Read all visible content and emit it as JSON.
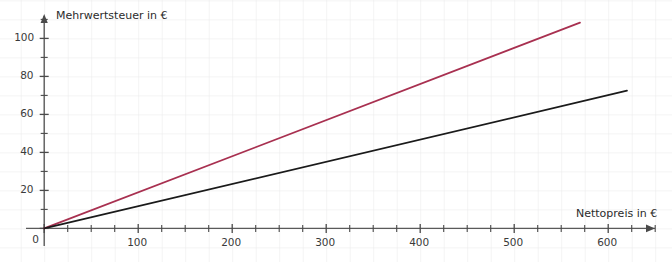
{
  "chart_data": {
    "type": "line",
    "title": "",
    "xlabel": "Nettopreis in €",
    "ylabel": "Mehrwertsteuer in €",
    "xlim": [
      0,
      660
    ],
    "ylim": [
      0,
      112
    ],
    "grid": true,
    "legend": "none",
    "x_ticks_major": [
      0,
      100,
      200,
      300,
      400,
      500,
      600
    ],
    "x_tick_labels": [
      "0",
      "100",
      "200",
      "300",
      "400",
      "500",
      "600"
    ],
    "x_tick_minor_step": 25,
    "y_ticks_major": [
      0,
      20,
      40,
      60,
      80,
      100
    ],
    "y_tick_labels": [
      "0",
      "20",
      "40",
      "60",
      "80",
      "100"
    ],
    "y_tick_minor_step": 10,
    "origin_label": "0",
    "series": [
      {
        "name": "line-upper",
        "color": "#a83050",
        "slope": 0.19,
        "x": [
          0,
          570
        ],
        "values": [
          0,
          108.3
        ]
      },
      {
        "name": "line-lower",
        "color": "#1a1a1a",
        "slope": 0.117,
        "x": [
          0,
          620
        ],
        "values": [
          0,
          72.5
        ]
      }
    ]
  },
  "axes": {
    "x_axis_name": "x-axis",
    "y_axis_name": "y-axis",
    "arrow_x": "x-axis-arrow",
    "arrow_y": "y-axis-arrow"
  }
}
